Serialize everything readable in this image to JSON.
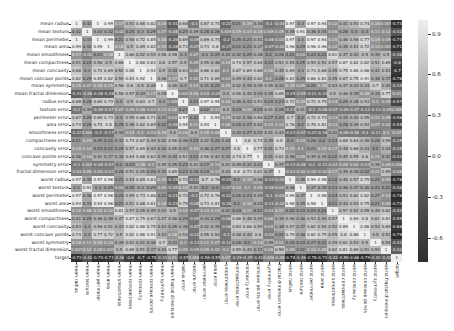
{
  "chart_data": {
    "type": "heatmap",
    "title": "",
    "xlabel": "",
    "ylabel": "",
    "colormap": "grayscale (dark = negative, light = positive)",
    "color_range": [
      -0.78,
      1.0
    ],
    "colorbar_ticks": [
      "0.9",
      "0.6",
      "0.3",
      "0.0",
      "-0.3",
      "-0.6"
    ],
    "colorbar_tick_values": [
      0.9,
      0.6,
      0.3,
      0.0,
      -0.3,
      -0.6
    ],
    "labels": [
      "mean radius",
      "mean texture",
      "mean perimeter",
      "mean area",
      "mean smoothness",
      "mean compactness",
      "mean concavity",
      "mean concave points",
      "mean symmetry",
      "mean fractal dimension",
      "radius error",
      "texture error",
      "perimeter error",
      "area error",
      "smoothness error",
      "compactness error",
      "concavity error",
      "concave points error",
      "symmetry error",
      "fractal dimension error",
      "worst radius",
      "worst texture",
      "worst perimeter",
      "worst area",
      "worst smoothness",
      "worst compactness",
      "worst concavity",
      "worst concave points",
      "worst symmetry",
      "worst fractal dimension",
      "target"
    ],
    "target_row": [
      -0.73,
      -0.42,
      -0.74,
      -0.71,
      -0.36,
      -0.6,
      -0.7,
      -0.78,
      -0.33,
      0.013,
      -0.57,
      0.0083,
      -0.56,
      -0.55,
      0.067,
      -0.29,
      -0.25,
      -0.41,
      0.0065,
      -0.078,
      -0.78,
      -0.46,
      -0.78,
      -0.73,
      -0.42,
      -0.59,
      -0.66,
      -0.79,
      -0.42,
      -0.32,
      1
    ],
    "matrix": [
      [
        1,
        0.32,
        1,
        0.99,
        0.17,
        0.51,
        0.68,
        0.82,
        0.15,
        -0.31,
        0.68,
        -0.097,
        0.67,
        0.74,
        -0.22,
        0.21,
        0.19,
        0.38,
        -0.1,
        -0.043,
        0.97,
        0.3,
        0.97,
        0.94,
        0.12,
        0.41,
        0.53,
        0.74,
        0.16,
        0.0071,
        -0.73
      ],
      [
        0.32,
        1,
        0.33,
        0.32,
        -0.023,
        0.24,
        0.3,
        0.29,
        0.071,
        -0.076,
        0.28,
        0.39,
        0.28,
        0.26,
        0.0066,
        0.19,
        0.14,
        0.16,
        0.0091,
        0.054,
        0.35,
        0.91,
        0.36,
        0.34,
        0.078,
        0.28,
        0.3,
        0.3,
        0.11,
        0.12,
        -0.42
      ],
      [
        1,
        0.33,
        1,
        0.99,
        0.21,
        0.56,
        0.72,
        0.85,
        0.18,
        -0.26,
        0.69,
        -0.087,
        0.69,
        0.74,
        -0.2,
        0.25,
        0.23,
        0.41,
        -0.082,
        -0.0055,
        0.97,
        0.3,
        0.97,
        0.94,
        0.15,
        0.46,
        0.56,
        0.77,
        0.19,
        0.051,
        -0.74
      ],
      [
        0.99,
        0.32,
        0.99,
        1,
        0.18,
        0.5,
        0.69,
        0.82,
        0.15,
        -0.28,
        0.73,
        -0.066,
        0.73,
        0.8,
        -0.17,
        0.21,
        0.21,
        0.37,
        -0.072,
        -0.02,
        0.96,
        0.29,
        0.96,
        0.96,
        0.12,
        0.39,
        0.51,
        0.72,
        0.14,
        0.0037,
        -0.71
      ],
      [
        0.17,
        -0.023,
        0.21,
        0.18,
        1,
        0.66,
        0.52,
        0.55,
        0.56,
        0.58,
        0.3,
        0.068,
        0.3,
        0.25,
        0.33,
        0.32,
        0.25,
        0.38,
        0.2,
        0.28,
        0.21,
        0.036,
        0.24,
        0.21,
        0.81,
        0.47,
        0.43,
        0.5,
        0.39,
        0.5,
        -0.36
      ],
      [
        0.51,
        0.24,
        0.56,
        0.5,
        0.66,
        1,
        0.88,
        0.83,
        0.6,
        0.57,
        0.5,
        0.046,
        0.55,
        0.46,
        0.14,
        0.74,
        0.57,
        0.64,
        0.23,
        0.51,
        0.54,
        0.25,
        0.59,
        0.51,
        0.57,
        0.87,
        0.82,
        0.82,
        0.51,
        0.69,
        -0.6
      ],
      [
        0.68,
        0.3,
        0.72,
        0.69,
        0.52,
        0.88,
        1,
        0.92,
        0.5,
        0.34,
        0.63,
        0.076,
        0.66,
        0.62,
        0.099,
        0.67,
        0.69,
        0.68,
        0.18,
        0.45,
        0.69,
        0.3,
        0.73,
        0.68,
        0.45,
        0.75,
        0.88,
        0.86,
        0.41,
        0.51,
        -0.7
      ],
      [
        0.82,
        0.29,
        0.85,
        0.82,
        0.55,
        0.83,
        0.92,
        1,
        0.46,
        0.17,
        0.7,
        0.021,
        0.71,
        0.69,
        0.028,
        0.49,
        0.44,
        0.62,
        0.095,
        0.26,
        0.83,
        0.29,
        0.86,
        0.81,
        0.45,
        0.67,
        0.75,
        0.91,
        0.38,
        0.37,
        -0.78
      ],
      [
        0.15,
        0.071,
        0.18,
        0.15,
        0.56,
        0.6,
        0.5,
        0.46,
        1,
        0.48,
        0.3,
        0.13,
        0.31,
        0.22,
        0.19,
        0.42,
        0.34,
        0.39,
        0.45,
        0.33,
        0.19,
        0.091,
        0.22,
        0.18,
        0.43,
        0.47,
        0.43,
        0.43,
        0.7,
        0.44,
        -0.33
      ],
      [
        -0.31,
        -0.076,
        -0.26,
        -0.28,
        0.58,
        0.57,
        0.34,
        0.17,
        0.48,
        1,
        0.00011,
        0.16,
        0.04,
        -0.09,
        0.4,
        0.56,
        0.45,
        0.34,
        0.35,
        0.69,
        -0.25,
        -0.051,
        -0.21,
        -0.23,
        0.5,
        0.46,
        0.35,
        0.18,
        0.33,
        0.77,
        0.013
      ],
      [
        0.68,
        0.28,
        0.69,
        0.73,
        0.3,
        0.5,
        0.63,
        0.7,
        0.3,
        0.00011,
        1,
        0.21,
        0.97,
        0.95,
        0.16,
        0.36,
        0.33,
        0.51,
        0.24,
        0.23,
        0.72,
        0.19,
        0.72,
        0.75,
        0.14,
        0.29,
        0.38,
        0.53,
        0.095,
        0.05,
        -0.57
      ],
      [
        -0.097,
        0.39,
        -0.087,
        -0.066,
        0.068,
        0.046,
        0.076,
        0.021,
        0.13,
        0.16,
        0.21,
        1,
        0.22,
        0.11,
        0.4,
        0.23,
        0.19,
        0.23,
        0.41,
        0.28,
        -0.11,
        0.41,
        -0.1,
        -0.083,
        -0.074,
        -0.092,
        -0.069,
        -0.12,
        -0.13,
        -0.046,
        0.0083
      ],
      [
        0.67,
        0.28,
        0.69,
        0.73,
        0.3,
        0.55,
        0.66,
        0.71,
        0.31,
        0.04,
        0.97,
        0.22,
        1,
        0.94,
        0.15,
        0.42,
        0.36,
        0.56,
        0.27,
        0.24,
        0.7,
        0.2,
        0.72,
        0.73,
        0.13,
        0.34,
        0.42,
        0.55,
        0.11,
        0.085,
        -0.56
      ],
      [
        0.74,
        0.26,
        0.74,
        0.8,
        0.25,
        0.46,
        0.62,
        0.69,
        0.22,
        -0.09,
        0.95,
        0.11,
        0.94,
        1,
        0.075,
        0.28,
        0.27,
        0.42,
        0.13,
        0.13,
        0.76,
        0.2,
        0.76,
        0.81,
        0.13,
        0.28,
        0.39,
        0.54,
        0.074,
        0.018,
        -0.55
      ],
      [
        -0.22,
        0.0066,
        -0.2,
        -0.17,
        0.33,
        0.14,
        0.099,
        0.028,
        0.19,
        0.4,
        0.16,
        0.4,
        0.15,
        0.075,
        1,
        0.34,
        0.27,
        0.33,
        0.41,
        0.43,
        -0.23,
        -0.075,
        -0.22,
        -0.18,
        0.31,
        -0.056,
        -0.058,
        -0.1,
        -0.11,
        0.1,
        0.067
      ],
      [
        0.21,
        0.19,
        0.25,
        0.21,
        0.32,
        0.74,
        0.67,
        0.49,
        0.42,
        0.56,
        0.36,
        0.23,
        0.42,
        0.28,
        0.34,
        1,
        0.8,
        0.74,
        0.39,
        0.8,
        0.2,
        0.14,
        0.26,
        0.2,
        0.23,
        0.68,
        0.64,
        0.48,
        0.28,
        0.59,
        -0.29
      ],
      [
        0.19,
        0.14,
        0.23,
        0.21,
        0.25,
        0.57,
        0.69,
        0.44,
        0.34,
        0.45,
        0.33,
        0.19,
        0.36,
        0.27,
        0.27,
        0.8,
        1,
        0.77,
        0.31,
        0.73,
        0.19,
        0.1,
        0.23,
        0.19,
        0.17,
        0.48,
        0.66,
        0.44,
        0.2,
        0.44,
        -0.25
      ],
      [
        0.38,
        0.16,
        0.41,
        0.37,
        0.38,
        0.64,
        0.68,
        0.62,
        0.39,
        0.34,
        0.51,
        0.23,
        0.56,
        0.42,
        0.33,
        0.74,
        0.77,
        1,
        0.31,
        0.61,
        0.36,
        0.087,
        0.39,
        0.34,
        0.22,
        0.45,
        0.55,
        0.6,
        0.14,
        0.31,
        -0.41
      ],
      [
        -0.1,
        0.0091,
        -0.082,
        -0.072,
        0.2,
        0.23,
        0.18,
        0.095,
        0.45,
        0.35,
        0.24,
        0.41,
        0.27,
        0.13,
        0.41,
        0.39,
        0.31,
        0.31,
        1,
        0.37,
        -0.13,
        -0.077,
        -0.1,
        -0.11,
        -0.013,
        0.06,
        0.037,
        -0.03,
        0.39,
        0.078,
        0.0065
      ],
      [
        -0.043,
        0.054,
        -0.0055,
        -0.02,
        0.28,
        0.51,
        0.45,
        0.26,
        0.33,
        0.69,
        0.23,
        0.28,
        0.24,
        0.13,
        0.43,
        0.8,
        0.73,
        0.61,
        0.37,
        1,
        -0.037,
        -0.0032,
        -0.001,
        -0.023,
        0.17,
        0.39,
        0.38,
        0.22,
        0.11,
        0.59,
        -0.078
      ],
      [
        0.97,
        0.35,
        0.97,
        0.96,
        0.21,
        0.54,
        0.69,
        0.83,
        0.19,
        -0.25,
        0.72,
        -0.11,
        0.7,
        0.76,
        -0.23,
        0.2,
        0.19,
        0.36,
        -0.13,
        -0.037,
        1,
        0.36,
        0.99,
        0.98,
        0.22,
        0.48,
        0.57,
        0.79,
        0.24,
        0.093,
        -0.78
      ],
      [
        0.3,
        0.91,
        0.3,
        0.29,
        0.036,
        0.25,
        0.3,
        0.29,
        0.091,
        -0.051,
        0.19,
        0.41,
        0.2,
        0.2,
        -0.075,
        0.14,
        0.1,
        0.087,
        -0.077,
        -0.0032,
        0.36,
        1,
        0.37,
        0.35,
        0.23,
        0.36,
        0.37,
        0.36,
        0.23,
        0.22,
        -0.46
      ],
      [
        0.97,
        0.36,
        0.97,
        0.96,
        0.24,
        0.59,
        0.73,
        0.86,
        0.22,
        -0.21,
        0.72,
        -0.1,
        0.72,
        0.76,
        -0.22,
        0.26,
        0.23,
        0.39,
        -0.1,
        -0.001,
        0.99,
        0.37,
        1,
        0.98,
        0.24,
        0.53,
        0.62,
        0.82,
        0.27,
        0.14,
        -0.78
      ],
      [
        0.94,
        0.34,
        0.94,
        0.96,
        0.21,
        0.51,
        0.68,
        0.81,
        0.18,
        -0.23,
        0.75,
        -0.083,
        0.73,
        0.81,
        -0.18,
        0.2,
        0.19,
        0.34,
        -0.11,
        -0.023,
        0.98,
        0.35,
        0.98,
        1,
        0.21,
        0.44,
        0.54,
        0.75,
        0.21,
        0.08,
        -0.73
      ],
      [
        0.12,
        0.078,
        0.15,
        0.12,
        0.81,
        0.57,
        0.45,
        0.45,
        0.43,
        0.5,
        0.14,
        -0.074,
        0.13,
        0.13,
        0.31,
        0.23,
        0.17,
        0.22,
        -0.013,
        0.17,
        0.22,
        0.23,
        0.24,
        0.21,
        1,
        0.57,
        0.52,
        0.55,
        0.49,
        0.62,
        -0.42
      ],
      [
        0.41,
        0.28,
        0.46,
        0.39,
        0.47,
        0.87,
        0.75,
        0.67,
        0.47,
        0.46,
        0.29,
        -0.092,
        0.34,
        0.28,
        -0.056,
        0.68,
        0.48,
        0.45,
        0.06,
        0.39,
        0.48,
        0.36,
        0.53,
        0.44,
        0.57,
        1,
        0.89,
        0.8,
        0.61,
        0.81,
        -0.59
      ],
      [
        0.53,
        0.3,
        0.56,
        0.51,
        0.43,
        0.82,
        0.88,
        0.75,
        0.43,
        0.35,
        0.38,
        -0.069,
        0.42,
        0.39,
        -0.058,
        0.64,
        0.66,
        0.55,
        0.037,
        0.38,
        0.57,
        0.37,
        0.62,
        0.54,
        0.52,
        0.89,
        1,
        0.86,
        0.53,
        0.69,
        -0.66
      ],
      [
        0.74,
        0.3,
        0.77,
        0.72,
        0.5,
        0.82,
        0.86,
        0.91,
        0.43,
        0.18,
        0.53,
        -0.12,
        0.55,
        0.54,
        -0.1,
        0.48,
        0.44,
        0.6,
        -0.03,
        0.22,
        0.79,
        0.36,
        0.82,
        0.75,
        0.55,
        0.8,
        0.86,
        1,
        0.5,
        0.51,
        -0.79
      ],
      [
        0.16,
        0.11,
        0.19,
        0.14,
        0.39,
        0.51,
        0.41,
        0.38,
        0.7,
        0.33,
        0.095,
        -0.13,
        0.11,
        0.074,
        -0.11,
        0.28,
        0.2,
        0.14,
        0.39,
        0.11,
        0.24,
        0.23,
        0.27,
        0.21,
        0.49,
        0.61,
        0.53,
        0.5,
        1,
        0.54,
        -0.42
      ],
      [
        0.0071,
        0.12,
        0.051,
        0.0037,
        0.5,
        0.69,
        0.51,
        0.37,
        0.44,
        0.77,
        0.05,
        -0.046,
        0.085,
        0.018,
        0.1,
        0.59,
        0.44,
        0.31,
        0.078,
        0.59,
        0.093,
        0.22,
        0.14,
        0.08,
        0.62,
        0.81,
        0.69,
        0.51,
        0.54,
        1,
        -0.32
      ],
      [
        -0.73,
        -0.42,
        -0.74,
        -0.71,
        -0.36,
        -0.6,
        -0.7,
        -0.78,
        -0.33,
        0.013,
        -0.57,
        0.0083,
        -0.56,
        -0.55,
        0.067,
        -0.29,
        -0.25,
        -0.41,
        0.0065,
        -0.078,
        -0.78,
        -0.46,
        -0.78,
        -0.73,
        -0.42,
        -0.59,
        -0.66,
        -0.79,
        -0.42,
        -0.32,
        1
      ]
    ]
  }
}
